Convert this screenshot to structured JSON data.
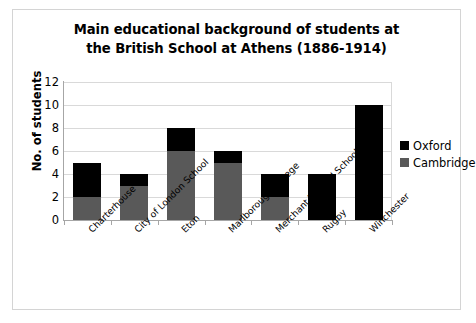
{
  "chart_data": {
    "type": "bar",
    "subtype": "stacked-vertical",
    "title": "Main educational background of students at the British School at Athens (1886-1914)",
    "title_line1": "Main educational background of students at",
    "title_line2": "the British School at Athens (1886-1914)",
    "xlabel": "",
    "ylabel": "No. of students",
    "ylim": [
      0,
      12
    ],
    "ytick_step": 2,
    "yticks": [
      12,
      10,
      8,
      6,
      4,
      2,
      0
    ],
    "grid": true,
    "grid_axis": "y",
    "legend_position": "right",
    "categories": [
      "Charterhouse",
      "City of London School",
      "Eton",
      "Marlborough College",
      "Merchant Taylors' School",
      "Rugby",
      "Winchester"
    ],
    "series": [
      {
        "name": "Cambridge",
        "color": "#595959",
        "values": [
          2,
          3,
          6,
          5,
          2,
          0,
          0
        ]
      },
      {
        "name": "Oxford",
        "color": "#000000",
        "values": [
          3,
          1,
          2,
          1,
          2,
          4,
          10
        ]
      }
    ],
    "totals": [
      5,
      4,
      8,
      6,
      4,
      4,
      10
    ]
  },
  "legend": {
    "items": [
      {
        "label": "Oxford",
        "color": "#000000",
        "swatch_name": "legend-swatch-oxford"
      },
      {
        "label": "Cambridge",
        "color": "#595959",
        "swatch_name": "legend-swatch-cambridge"
      }
    ]
  },
  "colors": {
    "oxford": "#000000",
    "cambridge": "#595959",
    "gridline": "#d9d9d9",
    "axis": "#a6a6a6",
    "frame_border": "#d4d4d4",
    "background": "#ffffff",
    "text": "#000000"
  }
}
